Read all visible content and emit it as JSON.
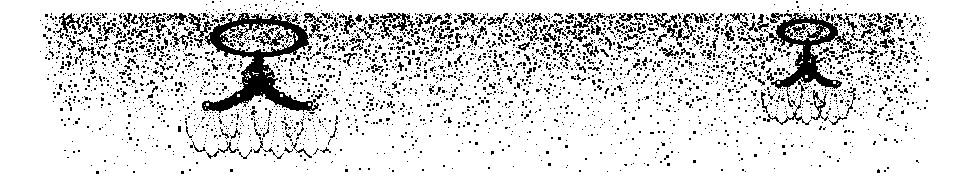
{
  "figure": {
    "kind": "scanned-halftone-engraving",
    "caption": "Dithered black-and-white scan of two ornate ceiling chandeliers beneath a stippled ceiling",
    "width": 967,
    "height": 190,
    "background_color": "#ffffff",
    "ink_color": "#000000",
    "tone": "pure black and white, no intermediate greys (1-bit dither)"
  },
  "canvas": {
    "paper_margin_left": 36,
    "paper_margin_top": 13,
    "stipple_field_right": 931,
    "stipple_field_bottom": 172
  },
  "stipple_field": {
    "name": "ceiling-stipple-gradient",
    "description": "Random 1-bit dither whose dot density decays from dense at the top edge to nearly empty at the bottom",
    "density_top": 0.46,
    "density_bottom": 0.012,
    "dot_size_min": 1,
    "dot_size_max": 3,
    "falloff": "exponential",
    "left_edge_slant_px": 14,
    "right_edge_feather_px": 40,
    "seed": 20240517
  },
  "objects": [
    {
      "id": "chandelier-large",
      "label": "Large ceiling chandelier",
      "center_x": 258,
      "top_y": 18,
      "scale": 1.0,
      "arms": 4,
      "shades": 4,
      "crown": {
        "label": "canopy ring",
        "cx": 258,
        "cy": 37,
        "rx": 44,
        "ry": 17,
        "ring_thickness": 8
      },
      "stem": {
        "cx": 258,
        "y_top": 50,
        "y_bottom": 72,
        "width": 9
      },
      "hub": {
        "cx": 258,
        "cy": 78,
        "rx": 26,
        "ry": 12
      },
      "scroll_arms": [
        {
          "side": "left-outer",
          "end_x": 207,
          "end_y": 104,
          "droop": 20
        },
        {
          "side": "left-inner",
          "end_x": 238,
          "end_y": 95,
          "droop": 13
        },
        {
          "side": "right-inner",
          "end_x": 281,
          "end_y": 95,
          "droop": 13
        },
        {
          "side": "right-outer",
          "end_x": 309,
          "end_y": 104,
          "droop": 20
        }
      ],
      "skirts": [
        {
          "cx": 211,
          "cy": 112,
          "rx": 26,
          "ry": 38,
          "lobes": 5
        },
        {
          "cx": 244,
          "cy": 106,
          "rx": 25,
          "ry": 44,
          "lobes": 5
        },
        {
          "cx": 278,
          "cy": 106,
          "rx": 25,
          "ry": 44,
          "lobes": 5
        },
        {
          "cx": 310,
          "cy": 112,
          "rx": 26,
          "ry": 38,
          "lobes": 5
        }
      ],
      "radiance": {
        "cx": 258,
        "cy": 40,
        "rays": 34,
        "length": 95
      }
    },
    {
      "id": "chandelier-small",
      "label": "Smaller ceiling chandelier at right",
      "center_x": 806,
      "top_y": 16,
      "scale": 0.62,
      "arms": 3,
      "shades": 3,
      "crown": {
        "label": "canopy ring",
        "cx": 806,
        "cy": 31,
        "rx": 27,
        "ry": 11,
        "ring_thickness": 6
      },
      "stem": {
        "cx": 806,
        "y_top": 40,
        "y_bottom": 58,
        "width": 7
      },
      "hub": {
        "cx": 806,
        "cy": 63,
        "rx": 18,
        "ry": 9
      },
      "scroll_arms": [
        {
          "side": "left",
          "end_x": 778,
          "end_y": 82,
          "droop": 14
        },
        {
          "side": "center",
          "end_x": 806,
          "end_y": 76,
          "droop": 9
        },
        {
          "side": "right",
          "end_x": 834,
          "end_y": 82,
          "droop": 14
        }
      ],
      "skirts": [
        {
          "cx": 781,
          "cy": 88,
          "rx": 20,
          "ry": 30,
          "lobes": 5
        },
        {
          "cx": 806,
          "cy": 84,
          "rx": 19,
          "ry": 34,
          "lobes": 5
        },
        {
          "cx": 833,
          "cy": 88,
          "rx": 20,
          "ry": 30,
          "lobes": 5
        }
      ],
      "radiance": {
        "cx": 806,
        "cy": 34,
        "rays": 26,
        "length": 62
      }
    }
  ]
}
